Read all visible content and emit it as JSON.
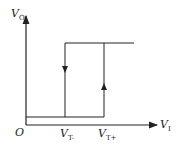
{
  "axes": {
    "y_label": "V",
    "y_sub": "O",
    "x_label": "V",
    "x_sub": "I",
    "origin": "O"
  },
  "thresholds": {
    "low": {
      "label": "V",
      "sub": "T-"
    },
    "high": {
      "label": "V",
      "sub": "T+"
    }
  },
  "colors": {
    "line": "#222222",
    "background": "#ffffff"
  }
}
